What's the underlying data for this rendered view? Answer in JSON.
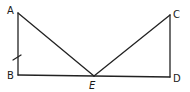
{
  "diagram": {
    "type": "geometry",
    "points": {
      "A": {
        "label": "A",
        "x": 18,
        "y": 13
      },
      "B": {
        "label": "B",
        "x": 18,
        "y": 75
      },
      "C": {
        "label": "C",
        "x": 170,
        "y": 15
      },
      "D": {
        "label": "D",
        "x": 170,
        "y": 77
      },
      "E": {
        "label": "E",
        "x": 94,
        "y": 76
      }
    },
    "segments": [
      "AB",
      "BE",
      "ED",
      "AE",
      "CE",
      "CD"
    ],
    "tick_marks": [
      {
        "segment": "AB",
        "count": 1
      }
    ],
    "colors": {
      "stroke": "#222222",
      "text": "#1a1a1a",
      "background": "#ffffff"
    }
  }
}
